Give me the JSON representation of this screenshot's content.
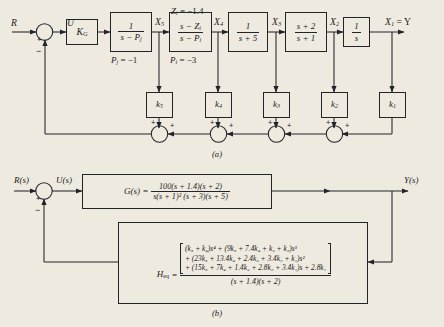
{
  "figure": {
    "caption_a": "(a)",
    "caption_b": "(b)"
  },
  "diagram_a": {
    "signals": {
      "input": "R",
      "u": "U",
      "x5": "X",
      "x5_sub": "5",
      "x4": "X",
      "x4_sub": "4",
      "x3": "X",
      "x3_sub": "3",
      "x2": "X",
      "x2_sub": "2",
      "x1_out": "X",
      "x1_sub": "1",
      "equals_y": "= Y"
    },
    "summer_signs": {
      "plus": "+",
      "minus": "−"
    },
    "annotations": {
      "zi": "Z",
      "zi_sub": "i",
      "zi_value": "= −1.4",
      "pj": "P",
      "pj_sub": "j",
      "pj_value": "= −1",
      "pi": "P",
      "pi_sub": "i",
      "pi_value": "= −3"
    },
    "blocks": [
      {
        "name": "gain-kg",
        "label": "K",
        "sub": "G",
        "type": "gain"
      },
      {
        "name": "pole-pj",
        "num": "1",
        "den_a": "s − P",
        "den_sub": "j",
        "type": "fraction"
      },
      {
        "name": "zero-pole-i",
        "num_a": "s − Z",
        "num_sub": "i",
        "den_a": "s − P",
        "den_sub": "i",
        "type": "fraction"
      },
      {
        "name": "pole-5",
        "num": "1",
        "den": "s + 5",
        "type": "fraction"
      },
      {
        "name": "lead-2-1",
        "num": "s + 2",
        "den": "s + 1",
        "type": "fraction"
      },
      {
        "name": "integrator",
        "num": "1",
        "den": "s",
        "type": "fraction"
      }
    ],
    "feedback_gains": [
      {
        "name": "gain-k5",
        "label": "k",
        "sub": "5"
      },
      {
        "name": "gain-k4",
        "label": "k",
        "sub": "4"
      },
      {
        "name": "gain-k3",
        "label": "k",
        "sub": "3"
      },
      {
        "name": "gain-k2",
        "label": "k",
        "sub": "2"
      },
      {
        "name": "gain-k1",
        "label": "k",
        "sub": "1"
      }
    ]
  },
  "diagram_b": {
    "signals": {
      "input": "R(s)",
      "u": "U(s)",
      "output": "Y(s)"
    },
    "summer_signs": {
      "plus": "+",
      "minus": "−"
    },
    "forward": {
      "name": "G(s)",
      "equals": "=",
      "numerator": "100(s + 1.4)(s + 2)",
      "denominator": "s(s + 1)² (s + 3)(s + 5)"
    },
    "feedback": {
      "name": "H",
      "name_sub": "eq",
      "equals": "=",
      "numerator_lines": [
        "(k₅ + k₄)s⁴ + (9k₅ + 7.4k₄ + k₃ + k₂)s³",
        "+ (23k₅ + 13.4k₄ + 2.4k₃ + 3.4k₂ + k₁)s²",
        "+ (15k₅ + 7k₄ + 1.4k₃ + 2.8k₂ + 3.4k₁)s + 2.8k₁"
      ],
      "denominator": "(s + 1.4)(s + 2)"
    }
  },
  "colors": {
    "background": "#efeae0",
    "ink": "#22242a"
  }
}
